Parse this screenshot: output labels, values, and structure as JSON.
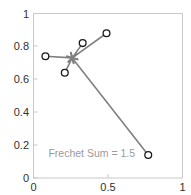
{
  "chart_data": {
    "type": "scatter",
    "title": "",
    "xlabel": "",
    "ylabel": "",
    "xlim": [
      0,
      1
    ],
    "ylim": [
      0,
      1
    ],
    "grid": false,
    "legend": null,
    "xticks": [
      "0",
      "0.5",
      "1"
    ],
    "xtick_values": [
      0,
      0.5,
      1
    ],
    "yticks": [
      "0",
      "0.2",
      "0.4",
      "0.6",
      "0.8",
      "1"
    ],
    "ytick_values": [
      0,
      0.2,
      0.4,
      0.6,
      0.8,
      1
    ],
    "series": [
      {
        "name": "data-points",
        "marker": "circle-open",
        "color": "#1a1a1a",
        "x": [
          0.08,
          0.21,
          0.33,
          0.49,
          0.77
        ],
        "y": [
          0.74,
          0.64,
          0.82,
          0.88,
          0.14
        ]
      },
      {
        "name": "frechet-mean",
        "marker": "star",
        "color": "#808080",
        "x": [
          0.26
        ],
        "y": [
          0.73
        ]
      }
    ],
    "connections": {
      "name": "spokes-to-mean",
      "color": "#808080",
      "from": {
        "x": 0.26,
        "y": 0.73
      },
      "to_x": [
        0.08,
        0.21,
        0.33,
        0.49,
        0.77
      ],
      "to_y": [
        0.74,
        0.64,
        0.82,
        0.88,
        0.14
      ]
    },
    "annotations": [
      {
        "name": "frechet-sum-label",
        "text": "Frechet Sum = 1.5",
        "x": 0.1,
        "y": 0.13,
        "color": "#9a9a9a"
      }
    ]
  },
  "colors": {
    "axis": "#c8c8c8",
    "tick_text": "#303030",
    "line": "#808080",
    "marker_edge": "#1a1a1a",
    "annotation": "#9a9a9a",
    "background": "#ffffff"
  }
}
